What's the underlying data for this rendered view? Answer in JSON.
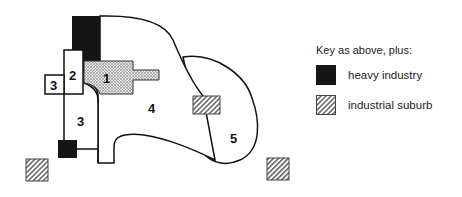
{
  "diagram": {
    "zones": [
      {
        "id": "1",
        "label": "1",
        "fill": "dotted"
      },
      {
        "id": "2",
        "label": "2",
        "fill": "white"
      },
      {
        "id": "3a",
        "label": "3",
        "fill": "white"
      },
      {
        "id": "3b",
        "label": "3",
        "fill": "white"
      },
      {
        "id": "4",
        "label": "4",
        "fill": "white"
      },
      {
        "id": "5",
        "label": "5",
        "fill": "white"
      }
    ]
  },
  "legend": {
    "title": "Key as above, plus:",
    "items": [
      {
        "label": "heavy industry",
        "type": "heavy-industry",
        "color": "#151515"
      },
      {
        "label": "industrial suburb",
        "type": "industrial-suburb",
        "color": "#777777"
      }
    ]
  }
}
